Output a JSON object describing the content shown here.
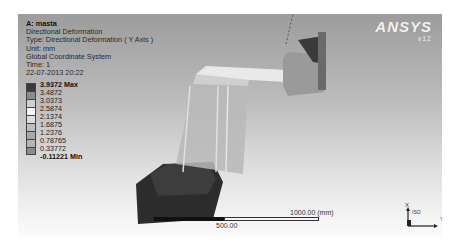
{
  "info": {
    "title": "A: masta",
    "result": "Directional Deformation",
    "type": "Type: Directional Deformation ( Y Axis )",
    "unit": "Unit: mm",
    "coordinate_system": "Global Coordinate System",
    "time": "Time: 1",
    "date": "22-07-2013 20:22"
  },
  "legend": {
    "labels": [
      "3.9372 Max",
      "3.4872",
      "3.0373",
      "2.5874",
      "2.1374",
      "1.6875",
      "1.2376",
      "0.78765",
      "0.33772",
      "-0.11221 Min"
    ],
    "colors": [
      "#3a3a3a",
      "#8a8a8a",
      "#cfcfcf",
      "#f5f5f5",
      "#dcdcdc",
      "#bdbdbd",
      "#a8a8a8",
      "#b5b5b5",
      "#8c8c8c",
      "#444444"
    ]
  },
  "logo": {
    "brand": "ANSYS",
    "version": "v12"
  },
  "scale": {
    "end_label": "1000.00 (mm)",
    "mid_label": "500.00"
  },
  "triad": {
    "x_label": "X",
    "y_label": "Y",
    "iso_label": "ISO"
  }
}
